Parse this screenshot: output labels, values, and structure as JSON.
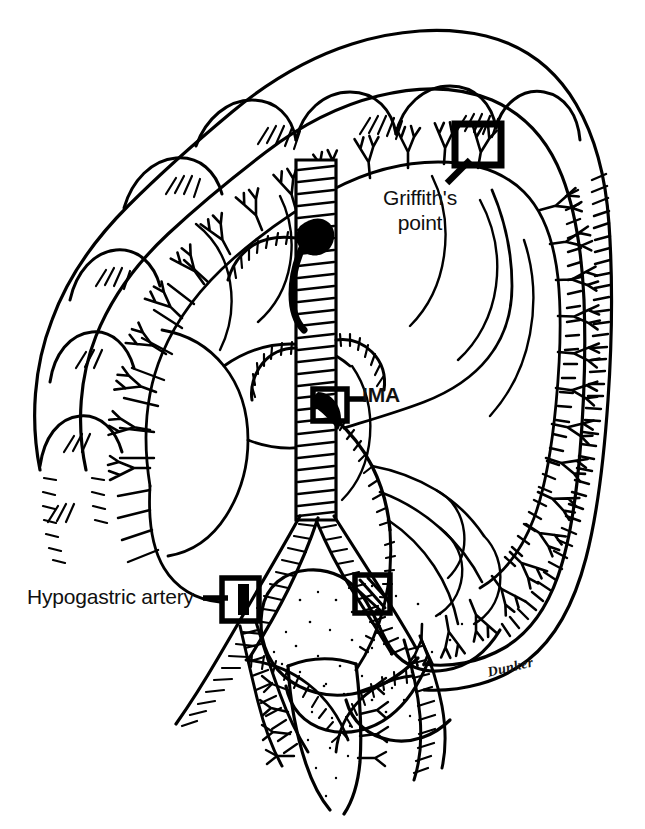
{
  "figure": {
    "background_color": "#ffffff",
    "ink_color": "#000000",
    "width": 645,
    "height": 829
  },
  "labels": [
    {
      "id": "griffiths",
      "name": "griffiths-point-label",
      "line1": "Griffith's",
      "line2": "point",
      "bold": false,
      "leader_line": true,
      "marker_box": true
    },
    {
      "id": "ima",
      "name": "ima-label",
      "text": "IMA",
      "bold": true,
      "leader_line": true,
      "marker_box": true
    },
    {
      "id": "hypogastric",
      "name": "hypogastric-artery-label",
      "text": "Hypogastric artery",
      "bold": false,
      "leader_line": true,
      "marker_box": true
    }
  ],
  "signature": {
    "text": "Dunker"
  },
  "markers": [
    {
      "id": "griffiths-box",
      "label": "Griffith's point",
      "x": 455,
      "y": 124,
      "width": 46,
      "height": 41
    },
    {
      "id": "ima-box",
      "label": "IMA",
      "x": 313,
      "y": 389,
      "width": 34,
      "height": 32
    },
    {
      "id": "hypogastric-box",
      "label": "Hypogastric artery",
      "x": 222,
      "y": 578,
      "width": 37,
      "height": 43
    },
    {
      "id": "sudeck-box",
      "label": "",
      "x": 355,
      "y": 575,
      "width": 35,
      "height": 38
    }
  ],
  "anatomy": {
    "structures": [
      "transverse colon",
      "ascending colon",
      "descending colon",
      "sigmoid colon",
      "rectum",
      "aorta",
      "superior mesenteric artery",
      "inferior mesenteric artery",
      "marginal artery of Drummond",
      "common iliac arteries",
      "hypogastric arteries",
      "vasa recta"
    ]
  }
}
